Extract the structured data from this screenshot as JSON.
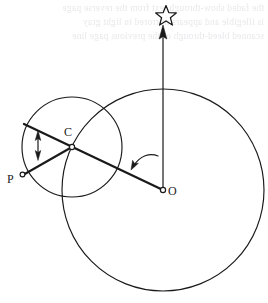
{
  "figure": {
    "background_color": "#ffffff",
    "stroke_color": "#1a1a1a",
    "width": 268,
    "height": 303,
    "labels": {
      "center_small_circle": "C",
      "point_on_small_circle": "P",
      "center_large_circle": "O"
    },
    "icons": {
      "star": "star-icon",
      "up_arrow": "up-arrow-icon",
      "double_arrow": "double-headed-arrow-icon",
      "curved_arrow": "curved-arrow-icon"
    },
    "ghost_text": {
      "line1": "the faded show-through text from the reverse page",
      "line2": "is illegible and appears mirrored in light gray",
      "line3": "scanned bleed-through of the previous page line"
    },
    "geometry": {
      "large_circle": {
        "cx": 163,
        "cy": 190,
        "r": 101
      },
      "small_circle": {
        "cx": 72,
        "cy": 147,
        "r": 50
      },
      "point_O": {
        "x": 163,
        "y": 190
      },
      "point_C": {
        "x": 72,
        "y": 147
      },
      "point_P": {
        "x": 23,
        "y": 175
      },
      "star": {
        "x": 166,
        "y": 14
      },
      "vertical_arrow": {
        "x": 163,
        "y_top": 28,
        "y_bottom": 188
      },
      "radius_line": {
        "x1": 163,
        "y1": 190,
        "x2": 24,
        "y2": 124
      },
      "chord_line": {
        "x1": 72,
        "y1": 147,
        "x2": 23,
        "y2": 175
      },
      "double_arrow": {
        "x": 38,
        "y_top": 132,
        "y_bottom": 159
      },
      "curved_arrow_tip": {
        "x": 131,
        "y": 169
      }
    }
  }
}
